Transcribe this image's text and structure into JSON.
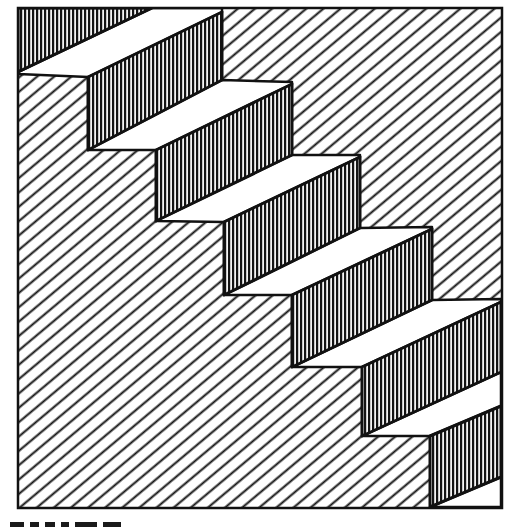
{
  "figure": {
    "kind": "line-art illustration",
    "colors": {
      "ink": "#111111",
      "paper": "#ffffff",
      "tread": "#ffffff"
    },
    "frame": {
      "x": 18,
      "y": 8,
      "width": 485,
      "height": 500,
      "stroke_width": 2.5
    },
    "background_hatch": {
      "angle_deg": -40,
      "spacing": 11,
      "stroke_width": 2
    },
    "riser_hatch": {
      "orientation": "vertical",
      "spacing": 4,
      "stroke_width": 2
    },
    "riser_geometry": {
      "width": 137,
      "top_slope_rise": 65,
      "height": 72
    },
    "risers": [
      {
        "id": 1,
        "points": "18,8 152,8 18,72"
      },
      {
        "id": 2,
        "points": "88,77 222,12 222,80 88,150"
      },
      {
        "id": 3,
        "points": "156,150 292,84 292,155 156,221"
      },
      {
        "id": 4,
        "points": "224,222 360,157 360,228 224,295"
      },
      {
        "id": 5,
        "points": "292,295 432,229 432,300 292,367"
      },
      {
        "id": 6,
        "points": "362,367 501,302 501,372 362,436"
      },
      {
        "id": 7,
        "points": "430,436 501,406 501,477 430,507"
      }
    ],
    "treads": [
      {
        "id": 1,
        "points": "152,8 222,8 222,12 88,77 18,74 18,72"
      },
      {
        "id": 2,
        "points": "222,80 292,82 292,84 156,150 88,150"
      },
      {
        "id": 3,
        "points": "292,155 360,155 360,157 224,222 156,221"
      },
      {
        "id": 4,
        "points": "360,228 432,227 432,229 292,295 224,295"
      },
      {
        "id": 5,
        "points": "432,300 501,299 501,302 362,367 292,367"
      },
      {
        "id": 6,
        "points": "501,372 501,406 430,436 362,436"
      },
      {
        "id": 7,
        "points": "501,477 501,507 430,507"
      }
    ],
    "step_count": 7
  },
  "caption": {
    "visible": "partially cut off at bottom edge; text not legible"
  }
}
